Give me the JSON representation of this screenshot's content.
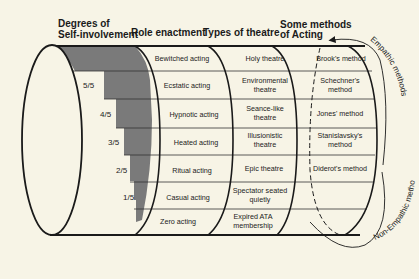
{
  "headers": {
    "self_involvement_1": "Degrees of",
    "self_involvement_2": "Self-involvement",
    "role_enactment": "Role enactment",
    "types_of_theatre": "Types of theatre",
    "methods_1": "Some methods",
    "methods_2": "of Acting"
  },
  "rows": [
    {
      "degree": "",
      "role": "Bewitched acting",
      "theatre_1": "Holy theatre",
      "theatre_2": "",
      "method_1": "Brook's method",
      "method_2": ""
    },
    {
      "degree": "5/5",
      "role": "Ecstatic acting",
      "theatre_1": "Environmental",
      "theatre_2": "theatre",
      "method_1": "Schechner's",
      "method_2": "method"
    },
    {
      "degree": "4/5",
      "role": "Hypnotic acting",
      "theatre_1": "Seance-like",
      "theatre_2": "theatre",
      "method_1": "Jones' method",
      "method_2": ""
    },
    {
      "degree": "3/5",
      "role": "Heated acting",
      "theatre_1": "Illusionistic",
      "theatre_2": "theatre",
      "method_1": "Stanislavsky's",
      "method_2": "method"
    },
    {
      "degree": "2/5",
      "role": "Ritual acting",
      "theatre_1": "Epic theatre",
      "theatre_2": "",
      "method_1": "Diderot's method",
      "method_2": ""
    },
    {
      "degree": "1/5",
      "role": "Casual acting",
      "theatre_1": "Spectator seated",
      "theatre_2": "quietly",
      "method_1": "",
      "method_2": ""
    },
    {
      "degree": "",
      "role": "Zero acting",
      "theatre_1": "Expired ATA",
      "theatre_2": "membership",
      "method_1": "",
      "method_2": ""
    }
  ],
  "arrows": {
    "empathic": "Empathic methods",
    "non_empathic": "Non-Empathic methods"
  },
  "colors": {
    "background": "#f7f4e6",
    "shade": "#7a7a7a",
    "line": "#1a1a1a"
  }
}
